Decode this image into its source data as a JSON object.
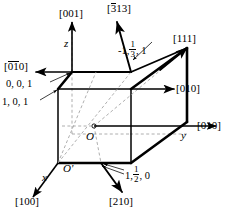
{
  "figure": {
    "name": "crystallographic-direction-cube-diagram",
    "colors": {
      "line": "#000000",
      "dashed": "#8c8c8c",
      "background": "#ffffff"
    }
  },
  "axes": {
    "z": {
      "label": "z",
      "direction_index": "[001]"
    },
    "y": {
      "label": "y",
      "direction_index": "[010]"
    },
    "x": {
      "label": "x",
      "direction_index": "[100]"
    },
    "origin_primary": "O",
    "origin_secondary": "O'"
  },
  "direction_labels": [
    {
      "id": "dir-001",
      "text": "[001]",
      "overbar": "none"
    },
    {
      "id": "dir-313bar",
      "text": "[313]",
      "overbar": "first-digit"
    },
    {
      "id": "dir-111",
      "text": "[111]",
      "overbar": "none"
    },
    {
      "id": "dir-010-upper",
      "text": "[010]",
      "overbar": "none"
    },
    {
      "id": "dir-010-lower",
      "text": "[010]",
      "overbar": "none"
    },
    {
      "id": "dir-0bar1bar0",
      "text": "[010]",
      "overbar": "zero-and-one"
    },
    {
      "id": "dir-100",
      "text": "[100]",
      "overbar": "none"
    },
    {
      "id": "dir-210",
      "text": "[210]",
      "overbar": "none"
    }
  ],
  "label_text": {
    "dir_001": "[001]",
    "dir_313": "313",
    "dir_111": "[111]",
    "dir_010_upper": "[010]",
    "dir_010_lower": "[010]",
    "dir_100": "[100]",
    "dir_210": "[210]",
    "bracket_open": "[",
    "bracket_close": "]",
    "zero": "0",
    "one": "1",
    "three": "3"
  },
  "point_coordinates": [
    {
      "id": "pt-001",
      "text": "0, 0, 1",
      "has_fraction": false
    },
    {
      "id": "pt-101",
      "text": "1, 0, 1",
      "has_fraction": false
    },
    {
      "id": "pt-m1-third-1",
      "prefix": "-1,",
      "num": "1",
      "den": "3",
      "suffix": ", 1",
      "has_fraction": true
    },
    {
      "id": "pt-1-half-0",
      "prefix": "1,",
      "num": "1",
      "den": "2",
      "suffix": ", 0",
      "has_fraction": true
    }
  ],
  "coordinate_text": {
    "p001": "0, 0, 1",
    "p101": "1, 0, 1",
    "p313_prefix": "-1,",
    "p313_num": "1",
    "p313_den": "3",
    "p313_suffix": ", 1",
    "p210_prefix": "1,",
    "p210_num": "1",
    "p210_den": "2",
    "p210_suffix": ", 0"
  },
  "axis_text": {
    "z": "z",
    "y": "y",
    "x": "x",
    "O": "O",
    "Oprime": "O'"
  }
}
